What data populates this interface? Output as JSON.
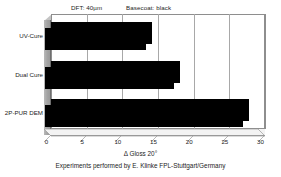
{
  "chart_data": {
    "type": "bar",
    "orientation": "horizontal",
    "title": "",
    "categories": [
      "UV-Cure",
      "Dual Cure",
      "2P-PUR DEM"
    ],
    "values": [
      14.2,
      18.1,
      27.7
    ],
    "xlabel": "Δ Gloss 20°",
    "ylabel": "",
    "xlim": [
      0,
      30
    ],
    "xticks": [
      0,
      5,
      10,
      15,
      20,
      25,
      30
    ],
    "xtick_labels": [
      "0",
      "5",
      "10",
      "15",
      "20",
      "25",
      "30"
    ],
    "grid": true,
    "grid_axis": "x",
    "legend": false,
    "bar_color": "#000000",
    "annotations": [
      {
        "text": "DFT: 40µm",
        "position": "top-left"
      },
      {
        "text": "Basecoat: black",
        "position": "top-center"
      }
    ],
    "footer": "Experiments performed by E. Klinke FPL-Stuttgart/Germany"
  },
  "header": {
    "dft_label": "DFT: 40µm",
    "basecoat_label": "Basecoat: black"
  },
  "axis": {
    "x_title": "Δ Gloss 20°"
  },
  "footer": {
    "credit": "Experiments performed by E. Klinke FPL-Stuttgart/Germany"
  },
  "colors": {
    "bar": "#000000",
    "wall": "#a3a3a3",
    "grid": "#a8a8a8",
    "frame": "#8e8e8e",
    "background": "#ffffff",
    "text": "#1c1c1c"
  }
}
